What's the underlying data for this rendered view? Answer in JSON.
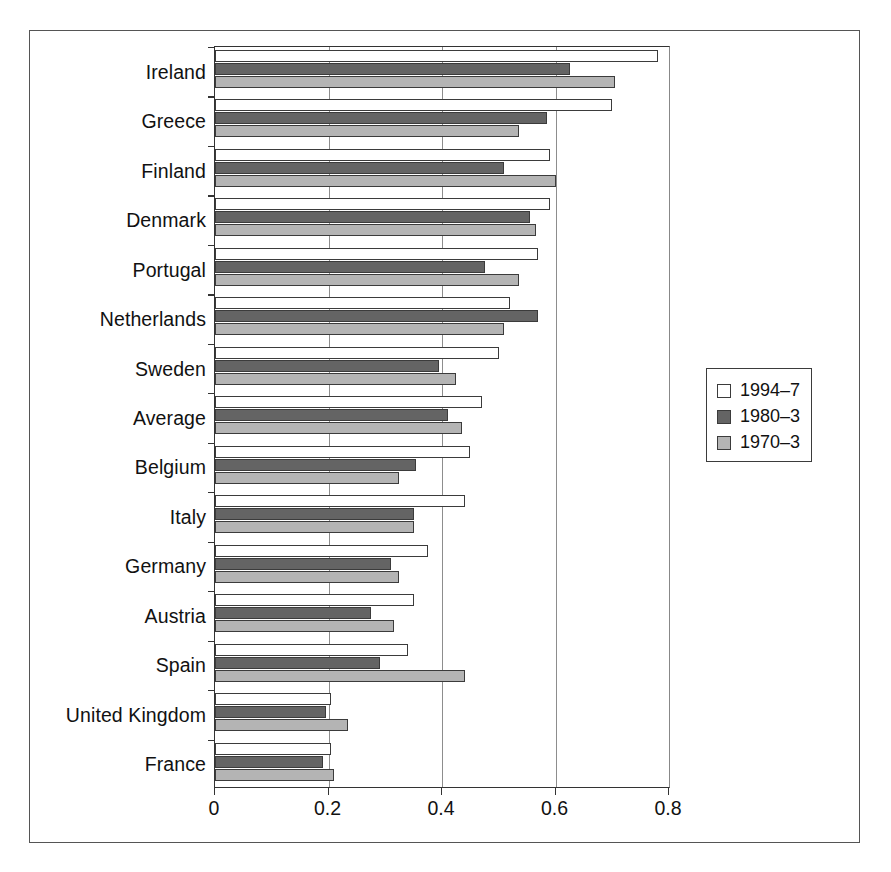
{
  "chart_data": {
    "type": "bar",
    "orientation": "horizontal",
    "title": "",
    "xlabel": "",
    "ylabel": "",
    "xlim": [
      0,
      0.8
    ],
    "xticks": [
      0,
      0.2,
      0.4,
      0.6,
      0.8
    ],
    "xticklabels": [
      "0",
      "0.2",
      "0.4",
      "0.6",
      "0.8"
    ],
    "grid": "vertical",
    "legend_position": "right",
    "categories": [
      "Ireland",
      "Greece",
      "Finland",
      "Denmark",
      "Portugal",
      "Netherlands",
      "Sweden",
      "Average",
      "Belgium",
      "Italy",
      "Germany",
      "Austria",
      "Spain",
      "United Kingdom",
      "France"
    ],
    "series": [
      {
        "name": "1994–7",
        "color": "#ffffff",
        "values": [
          0.78,
          0.7,
          0.59,
          0.59,
          0.57,
          0.52,
          0.5,
          0.47,
          0.45,
          0.44,
          0.375,
          0.35,
          0.34,
          0.205,
          0.205
        ]
      },
      {
        "name": "1980–3",
        "color": "#646464",
        "values": [
          0.625,
          0.585,
          0.51,
          0.555,
          0.475,
          0.57,
          0.395,
          0.41,
          0.355,
          0.35,
          0.31,
          0.275,
          0.29,
          0.195,
          0.19
        ]
      },
      {
        "name": "1970–3",
        "color": "#b4b4b4",
        "values": [
          0.705,
          0.535,
          0.6,
          0.565,
          0.535,
          0.51,
          0.425,
          0.435,
          0.325,
          0.35,
          0.325,
          0.315,
          0.44,
          0.235,
          0.21
        ]
      }
    ]
  },
  "legend": {
    "entries": [
      {
        "label": "1994–7",
        "swatch": "white-square-icon"
      },
      {
        "label": "1980–3",
        "swatch": "dark-gray-square-icon"
      },
      {
        "label": "1970–3",
        "swatch": "light-gray-square-icon"
      }
    ]
  }
}
